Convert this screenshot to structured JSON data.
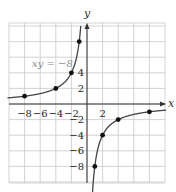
{
  "chart_data": {
    "type": "line",
    "title": "",
    "equation_label": "xy = −8",
    "function": "y = -8/x",
    "xlabel": "x",
    "ylabel": "y",
    "xlim": [
      -10,
      10
    ],
    "ylim": [
      -10,
      10.5
    ],
    "grid": true,
    "grid_step": 2,
    "x_ticks": [
      {
        "value": -8,
        "label": "−8"
      },
      {
        "value": -6,
        "label": "−6"
      },
      {
        "value": -4,
        "label": "−4"
      },
      {
        "value": -2,
        "label": "−2"
      },
      {
        "value": 2,
        "label": "2"
      }
    ],
    "y_ticks": [
      {
        "value": 4,
        "label": "4"
      },
      {
        "value": 2,
        "label": "2"
      },
      {
        "value": -2,
        "label": "−2"
      },
      {
        "value": -4,
        "label": "−4"
      },
      {
        "value": -6,
        "label": "−6"
      },
      {
        "value": -8,
        "label": "−8"
      }
    ],
    "series": [
      {
        "name": "xy = -8 (left branch)",
        "points": [
          [
            -8,
            1
          ],
          [
            -4,
            2
          ],
          [
            -2,
            4
          ],
          [
            -1,
            8
          ]
        ]
      },
      {
        "name": "xy = -8 (right branch)",
        "points": [
          [
            1,
            -8
          ],
          [
            2,
            -4
          ],
          [
            4,
            -2
          ],
          [
            8,
            -1
          ]
        ]
      }
    ],
    "colors": {
      "curve": "#444444",
      "grid": "#c8c8c8",
      "axis": "#333333",
      "point": "#111111"
    }
  }
}
